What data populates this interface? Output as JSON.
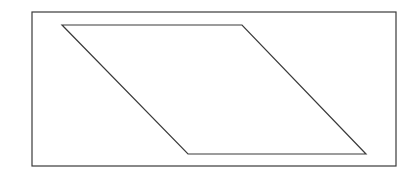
{
  "diagram": {
    "canvas": {
      "width": 416,
      "height": 173,
      "background": "#ffffff"
    },
    "stroke_color": "#3a3a3a",
    "frame": {
      "x": 32,
      "y": 12,
      "width": 364,
      "height": 154,
      "stroke_width": 1.2
    },
    "parallelogram": {
      "points": [
        [
          62,
          25
        ],
        [
          242,
          25
        ],
        [
          366,
          154
        ],
        [
          188,
          154
        ]
      ],
      "stroke_width": 1.2
    }
  }
}
